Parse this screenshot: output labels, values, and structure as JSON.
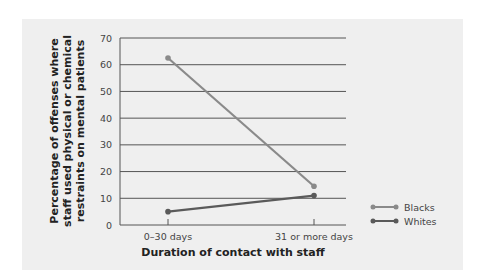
{
  "chart_data": {
    "type": "line",
    "title": "",
    "xlabel": "Duration of contact with staff",
    "ylabel_lines": [
      "Percentage of offenses where",
      "staff used physical or chemical",
      "restraints on mental patients"
    ],
    "ylabel": "Percentage of offenses where staff used physical or chemical restraints on mental patients",
    "categories": [
      "0–30 days",
      "31 or more days"
    ],
    "series": [
      {
        "name": "Blacks",
        "values": [
          62.5,
          14.5
        ],
        "color": "#8a8a8a"
      },
      {
        "name": "Whites",
        "values": [
          5,
          11
        ],
        "color": "#5a5a5a"
      }
    ],
    "ylim": [
      0,
      70
    ],
    "yticks": [
      "0",
      "10",
      "20",
      "30",
      "40",
      "50",
      "60",
      "70"
    ],
    "grid": true,
    "legend_position": "right"
  }
}
